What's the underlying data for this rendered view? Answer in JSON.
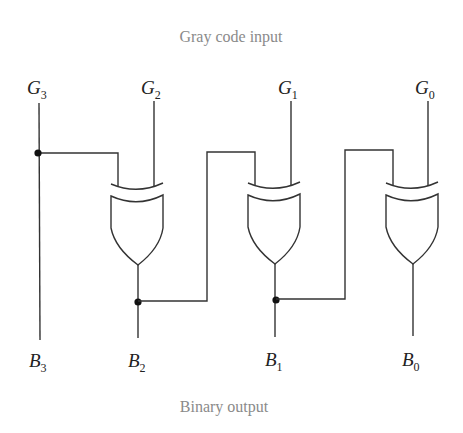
{
  "diagram": {
    "title_top": "Gray code input",
    "title_bottom": "Binary output",
    "inputs": [
      {
        "letter": "G",
        "sub": "3"
      },
      {
        "letter": "G",
        "sub": "2"
      },
      {
        "letter": "G",
        "sub": "1"
      },
      {
        "letter": "G",
        "sub": "0"
      }
    ],
    "outputs": [
      {
        "letter": "B",
        "sub": "3"
      },
      {
        "letter": "B",
        "sub": "2"
      },
      {
        "letter": "B",
        "sub": "1"
      },
      {
        "letter": "B",
        "sub": "0"
      }
    ],
    "gates": [
      {
        "type": "XOR",
        "inputs": [
          "G3",
          "G2"
        ],
        "output": "B2"
      },
      {
        "type": "XOR",
        "inputs": [
          "B2",
          "G1"
        ],
        "output": "B1"
      },
      {
        "type": "XOR",
        "inputs": [
          "B1",
          "G0"
        ],
        "output": "B0"
      }
    ],
    "colors": {
      "wire": "#333333",
      "caption": "#8a8a8a",
      "label": "#222222"
    }
  }
}
